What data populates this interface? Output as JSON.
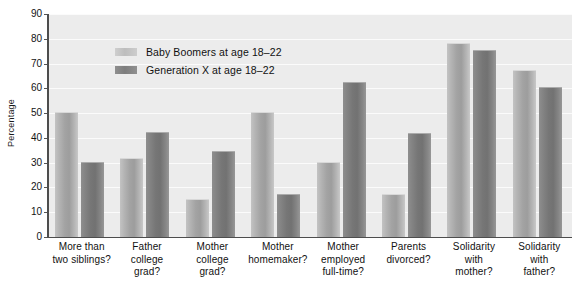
{
  "chart_data": {
    "type": "bar",
    "title": "",
    "xlabel": "",
    "ylabel": "Percentage",
    "ylim": [
      0,
      90
    ],
    "ytick_step": 10,
    "yticks": [
      90,
      80,
      70,
      60,
      50,
      40,
      30,
      20,
      10,
      0
    ],
    "grid": true,
    "legend_position": "inside-top-left",
    "categories": [
      "More than two siblings?",
      "Father college grad?",
      "Mother college grad?",
      "Mother homemaker?",
      "Mother employed full-time?",
      "Parents divorced?",
      "Solidarity with mother?",
      "Solidarity with father?"
    ],
    "category_lines": [
      [
        "More than",
        "two siblings?"
      ],
      [
        "Father",
        "college",
        "grad?"
      ],
      [
        "Mother",
        "college",
        "grad?"
      ],
      [
        "Mother",
        "homemaker?"
      ],
      [
        "Mother",
        "employed",
        "full-time?"
      ],
      [
        "Parents",
        "divorced?"
      ],
      [
        "Solidarity",
        "with",
        "mother?"
      ],
      [
        "Solidarity",
        "with",
        "father?"
      ]
    ],
    "series": [
      {
        "name": "Baby Boomers at age 18–22",
        "color": "#b4b4b4",
        "values": [
          50,
          31.5,
          15,
          50,
          30,
          17,
          78,
          67
        ]
      },
      {
        "name": "Generation X at age 18–22",
        "color": "#7d7d7d",
        "values": [
          30,
          42,
          34.5,
          17,
          62,
          41.5,
          75,
          60
        ]
      }
    ]
  },
  "legend": {
    "items": [
      {
        "label": "Baby Boomers at age 18–22"
      },
      {
        "label": "Generation X at age 18–22"
      }
    ]
  }
}
